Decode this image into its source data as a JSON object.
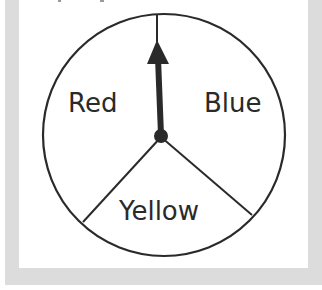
{
  "spinner": {
    "sections": [
      {
        "label": "Red"
      },
      {
        "label": "Blue"
      },
      {
        "label": "Yellow"
      }
    ],
    "pointer_direction": "up",
    "pointer_points_to": "boundary between Red and Blue"
  },
  "colors": {
    "frame": "#dcdcdc",
    "panel": "#ffffff",
    "ink": "#2a2a2a"
  }
}
